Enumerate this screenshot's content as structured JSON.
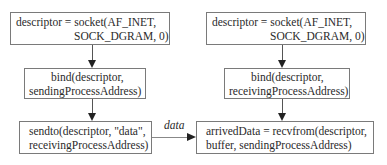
{
  "sender": {
    "socket": {
      "line1": "descriptor = socket(AF_INET,",
      "line2": "SOCK_DGRAM, 0)"
    },
    "bind": {
      "line1": "bind(descriptor,",
      "line2": "sendingProcessAddress)"
    },
    "sendto": {
      "line1": "sendto(descriptor, \"data\",",
      "line2": "receivingProcessAddress)"
    }
  },
  "receiver": {
    "socket": {
      "line1": "descriptor = socket(AF_INET,",
      "line2": "SOCK_DGRAM, 0)"
    },
    "bind": {
      "line1": "bind(descriptor,",
      "line2": "receivingProcessAddress)"
    },
    "recvfrom": {
      "line1": "arrivedData = recvfrom(descriptor,",
      "line2": "buffer, sendingProcessAddress)"
    }
  },
  "edge_label": "data",
  "colors": {
    "border": "#7a7a7a",
    "arrow": "#222222",
    "text": "#2a2a2a"
  }
}
